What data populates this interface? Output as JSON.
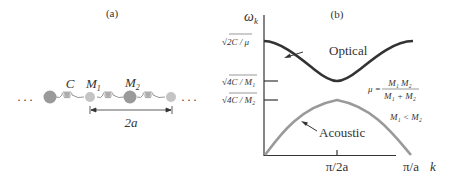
{
  "panel_a": {
    "label": "(a)",
    "spring_label": "C",
    "mass1_label": "M",
    "mass1_sub": "1",
    "mass2_label": "M",
    "mass2_sub": "2",
    "ellipsis_left": ". . .",
    "ellipsis_right": ". . .",
    "spacing_label": "2a",
    "colors": {
      "heavy_mass": "#9a9a9a",
      "light_mass": "#c4c4c4",
      "spring": "#8a8a8a"
    }
  },
  "panel_b": {
    "label": "(b)",
    "y_axis_label": "ω",
    "y_axis_sub": "k",
    "x_axis_label": "k",
    "y_ticks": [
      {
        "text": "√2C / μ"
      },
      {
        "text": "√4C / M₁"
      },
      {
        "text": "√4C / M₂"
      }
    ],
    "x_ticks": [
      {
        "text": "π/2a"
      },
      {
        "text": "π/a"
      }
    ],
    "optical_label": "Optical",
    "acoustic_label": "Acoustic",
    "mu_lhs": "μ =",
    "mu_num": "M₁ M₂",
    "mu_den": "M₁ + M₂",
    "condition": "M₁ < M₂",
    "colors": {
      "optical": "#333333",
      "acoustic": "#9a9a9a",
      "axis": "#333333"
    }
  }
}
